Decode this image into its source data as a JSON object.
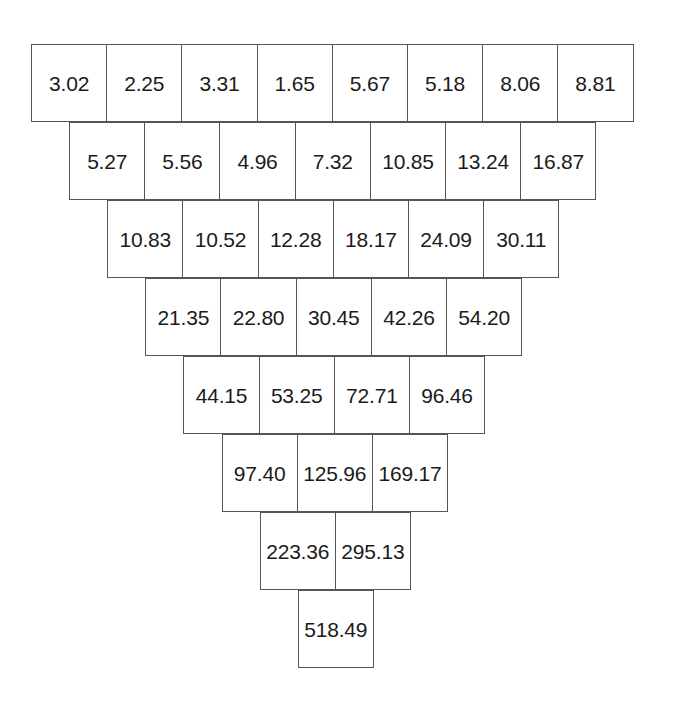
{
  "figure": {
    "name": "inverted-triangle-grid",
    "background_color": "#ffffff",
    "border_color": "#555555",
    "text_color": "#1b1b1b",
    "cell_width_px": 76,
    "cell_height_px": 78,
    "row_offset_px": 38
  },
  "chart_data": {
    "type": "table",
    "title": "",
    "subtitle": "",
    "xlabel": "",
    "ylabel": "",
    "grid": true,
    "legend": null,
    "orientation": "inverted-triangle",
    "row_count": 8,
    "row_offsets_px": [
      31,
      69,
      107,
      145,
      183,
      222,
      260,
      298
    ],
    "rows": [
      {
        "index": 0,
        "count": 8,
        "values": [
          "3.02",
          "2.25",
          "3.31",
          "1.65",
          "5.67",
          "5.18",
          "8.06",
          "8.81"
        ]
      },
      {
        "index": 1,
        "count": 7,
        "values": [
          "5.27",
          "5.56",
          "4.96",
          "7.32",
          "10.85",
          "13.24",
          "16.87"
        ]
      },
      {
        "index": 2,
        "count": 6,
        "values": [
          "10.83",
          "10.52",
          "12.28",
          "18.17",
          "24.09",
          "30.11"
        ]
      },
      {
        "index": 3,
        "count": 5,
        "values": [
          "21.35",
          "22.80",
          "30.45",
          "42.26",
          "54.20"
        ]
      },
      {
        "index": 4,
        "count": 4,
        "values": [
          "44.15",
          "53.25",
          "72.71",
          "96.46"
        ]
      },
      {
        "index": 5,
        "count": 3,
        "values": [
          "97.40",
          "125.96",
          "169.17"
        ]
      },
      {
        "index": 6,
        "count": 2,
        "values": [
          "223.36",
          "295.13"
        ]
      },
      {
        "index": 7,
        "count": 1,
        "values": [
          "518.49"
        ]
      }
    ]
  }
}
